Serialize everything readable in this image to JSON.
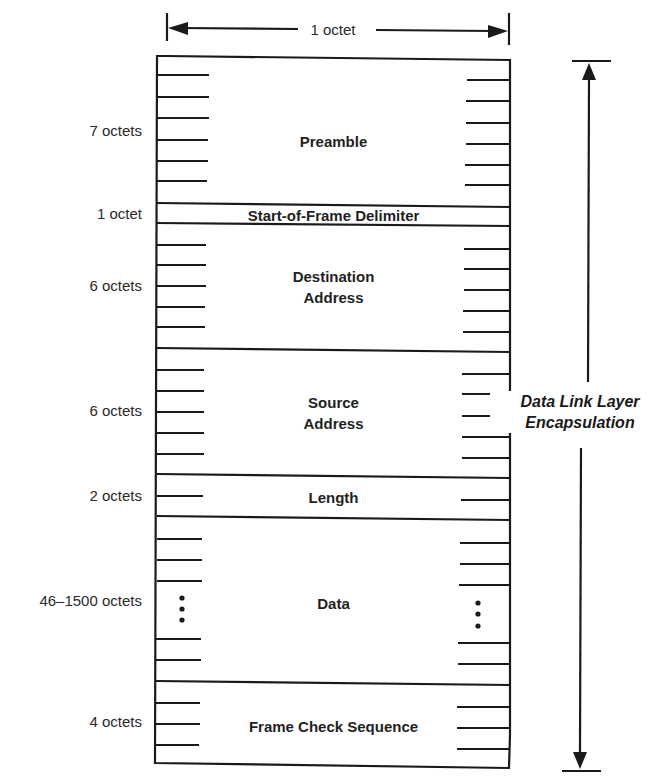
{
  "diagram": {
    "type": "ethernet-frame-format",
    "width_label": "1 octet",
    "side_label": {
      "line1": "Data Link Layer",
      "line2": "Encapsulation"
    },
    "fields": [
      {
        "name": "Preamble",
        "name_line2": "",
        "size": "7 octets"
      },
      {
        "name": "Start-of-Frame Delimiter",
        "name_line2": "",
        "size": "1 octet"
      },
      {
        "name": "Destination",
        "name_line2": "Address",
        "size": "6 octets"
      },
      {
        "name": "Source",
        "name_line2": "Address",
        "size": "6 octets"
      },
      {
        "name": "Length",
        "name_line2": "",
        "size": "2 octets"
      },
      {
        "name": "Data",
        "name_line2": "",
        "size": "46–1500 octets"
      },
      {
        "name": "Frame Check Sequence",
        "name_line2": "",
        "size": "4 octets"
      }
    ],
    "colors": {
      "line": "#1a1a1a",
      "background": "#ffffff"
    }
  }
}
